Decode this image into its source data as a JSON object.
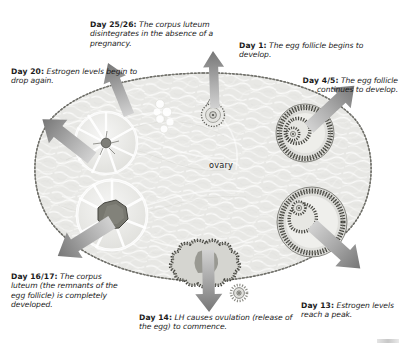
{
  "diagram": {
    "center_label": "ovary",
    "colors": {
      "stroma": "#e3e3e0",
      "stroma_light": "#f1f1ef",
      "outline": "#5d5d58",
      "arrow_dark": "#7d7d7d",
      "arrow_light": "#c9c9c9",
      "text": "#1b1b1b",
      "follicle_wall": "#4a4a46",
      "corpus_luteum": "#ececea",
      "egg": "#b9b9b4"
    }
  },
  "labels": [
    {
      "id": "day-25-26",
      "day": "Day 25/26:",
      "text": " The corpus luteum disintegrates in the absence of a pregnancy.",
      "structure": "degenerating-corpus-luteum"
    },
    {
      "id": "day-1",
      "day": "Day 1:",
      "text": " The egg follicle begins to develop.",
      "structure": "primordial-follicle"
    },
    {
      "id": "day-20",
      "day": "Day 20:",
      "text": " Estrogen levels begin to drop again.",
      "structure": "regressing-corpus-luteum"
    },
    {
      "id": "day-4-5",
      "day": "Day 4/5:",
      "text": " The egg follicle continues to develop.",
      "structure": "developing-follicle"
    },
    {
      "id": "day-16-17",
      "day": "Day 16/17:",
      "text": " The corpus luteum (the remnants of the egg follicle) is completely developed.",
      "structure": "mature-corpus-luteum"
    },
    {
      "id": "day-14",
      "day": "Day 14:",
      "text": " LH causes ovulation (release of the egg) to commence.",
      "structure": "ruptured-follicle"
    },
    {
      "id": "day-13",
      "day": "Day 13:",
      "text": " Estrogen levels reach a peak.",
      "structure": "graafian-follicle"
    }
  ],
  "structures": [
    {
      "id": "primordial-follicle",
      "name": "primordial follicle (Day 1)"
    },
    {
      "id": "developing-follicle",
      "name": "developing egg follicle (Day 4/5)"
    },
    {
      "id": "graafian-follicle",
      "name": "mature Graafian follicle (Day 13)"
    },
    {
      "id": "ruptured-follicle",
      "name": "ruptured follicle at ovulation (Day 14)"
    },
    {
      "id": "released-egg",
      "name": "released egg"
    },
    {
      "id": "mature-corpus-luteum",
      "name": "corpus luteum (Day 16/17)"
    },
    {
      "id": "regressing-corpus-luteum",
      "name": "regressing corpus luteum (Day 20)"
    },
    {
      "id": "degenerating-corpus-luteum",
      "name": "degenerating corpus luteum (Day 25/26)"
    }
  ],
  "arrows": [
    {
      "id": "arrow-day-25-26",
      "direction": "up-left"
    },
    {
      "id": "arrow-day-1",
      "direction": "up"
    },
    {
      "id": "arrow-day-20",
      "direction": "up-left"
    },
    {
      "id": "arrow-day-4-5",
      "direction": "up-right"
    },
    {
      "id": "arrow-day-16-17",
      "direction": "down-left"
    },
    {
      "id": "arrow-day-14",
      "direction": "down"
    },
    {
      "id": "arrow-day-13",
      "direction": "down-right"
    }
  ]
}
